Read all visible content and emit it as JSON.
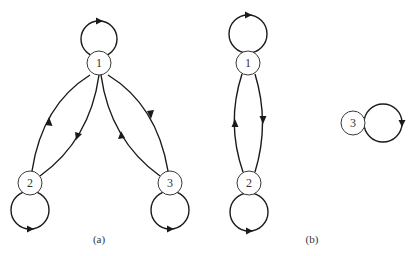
{
  "diagrams": [
    {
      "caption": "(a)",
      "nodes": [
        {
          "id": "1",
          "label": "1"
        },
        {
          "id": "2",
          "label": "2"
        },
        {
          "id": "3",
          "label": "3"
        }
      ],
      "edges": [
        {
          "from": "1",
          "to": "1",
          "type": "self-loop"
        },
        {
          "from": "2",
          "to": "2",
          "type": "self-loop"
        },
        {
          "from": "3",
          "to": "3",
          "type": "self-loop"
        },
        {
          "from": "2",
          "to": "1"
        },
        {
          "from": "1",
          "to": "2"
        },
        {
          "from": "1",
          "to": "3"
        },
        {
          "from": "3",
          "to": "1"
        }
      ]
    },
    {
      "caption": "(b)",
      "nodes": [
        {
          "id": "1",
          "label": "1"
        },
        {
          "id": "2",
          "label": "2"
        },
        {
          "id": "3",
          "label": "3"
        }
      ],
      "edges": [
        {
          "from": "1",
          "to": "1",
          "type": "self-loop"
        },
        {
          "from": "2",
          "to": "2",
          "type": "self-loop"
        },
        {
          "from": "3",
          "to": "3",
          "type": "self-loop"
        },
        {
          "from": "1",
          "to": "2"
        },
        {
          "from": "2",
          "to": "1"
        }
      ]
    }
  ],
  "colors": {
    "stroke": "#1a1a1a",
    "background": "#ffffff"
  }
}
